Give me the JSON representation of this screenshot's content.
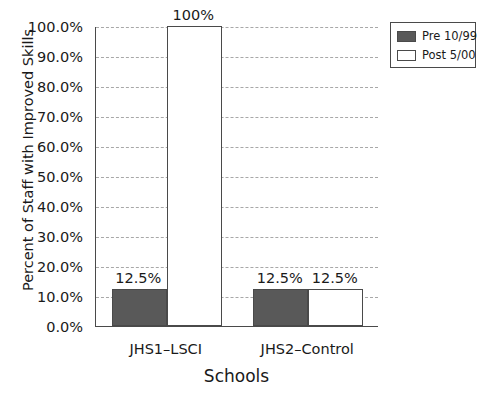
{
  "chart_data": {
    "type": "bar",
    "title": "",
    "xlabel": "Schools",
    "ylabel": "Percent of Staff with Improved Skills",
    "categories": [
      "JHS1–LSCI",
      "JHS2–Control"
    ],
    "series": [
      {
        "name": "Pre 10/99",
        "values": [
          12.5,
          12.5
        ],
        "color": "#595959"
      },
      {
        "name": "Post 5/00",
        "values": [
          100,
          12.5
        ],
        "color": "#ffffff"
      }
    ],
    "data_labels": [
      {
        "series": "Pre 10/99",
        "category": "JHS1–LSCI",
        "text": "12.5%"
      },
      {
        "series": "Post 5/00",
        "category": "JHS1–LSCI",
        "text": "100%"
      },
      {
        "series": "Pre 10/99",
        "category": "JHS2–Control",
        "text": "12.5%"
      },
      {
        "series": "Post 5/00",
        "category": "JHS2–Control",
        "text": "12.5%"
      }
    ],
    "ylim": [
      0,
      100
    ],
    "ytick_values": [
      0,
      10,
      20,
      30,
      40,
      50,
      60,
      70,
      80,
      90,
      100
    ],
    "ytick_labels": [
      "0.0%",
      "10.0%",
      "20.0%",
      "30.0%",
      "40.0%",
      "50.0%",
      "60.0%",
      "70.0%",
      "80.0%",
      "90.0%",
      "100.0%"
    ],
    "grid": true,
    "legend_position": "top-right"
  },
  "legend": {
    "items": [
      {
        "label": "Pre 10/99",
        "color": "#595959"
      },
      {
        "label": "Post 5/00",
        "color": "#ffffff"
      }
    ]
  }
}
